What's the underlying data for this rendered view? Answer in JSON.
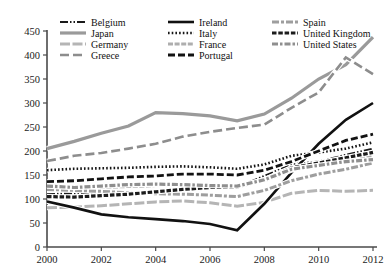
{
  "chart_data": {
    "type": "line",
    "title": "",
    "xlabel": "",
    "ylabel": "",
    "xlim": [
      2000,
      2012
    ],
    "ylim": [
      0,
      450
    ],
    "ytick_labels": [
      "0",
      "50",
      "100",
      "150",
      "200",
      "250",
      "300",
      "350",
      "400",
      "450"
    ],
    "yticks": [
      0,
      50,
      100,
      150,
      200,
      250,
      300,
      350,
      400,
      450
    ],
    "xtick_labels": [
      "2000",
      "2002",
      "2004",
      "2006",
      "2008",
      "2010",
      "2012"
    ],
    "xticks": [
      2000,
      2002,
      2004,
      2006,
      2008,
      2010,
      2012
    ],
    "grid": false,
    "legend_position": "top-left-inside",
    "x": [
      2000,
      2001,
      2002,
      2003,
      2004,
      2005,
      2006,
      2007,
      2008,
      2009,
      2010,
      2011,
      2012
    ],
    "series": [
      {
        "name": "Belgium",
        "values": [
          110,
          112,
          114,
          113,
          115,
          118,
          122,
          125,
          148,
          172,
          178,
          192,
          205
        ],
        "color": "#1a1a1a",
        "width": 2.0,
        "dash": "8,2,1.5,2,1.5,2"
      },
      {
        "name": "Japan",
        "values": [
          205,
          220,
          237,
          252,
          280,
          278,
          273,
          263,
          277,
          310,
          350,
          380,
          437
        ],
        "color": "#9a9a9a",
        "width": 3.2,
        "dash": "none"
      },
      {
        "name": "Germany",
        "values": [
          82,
          83,
          86,
          90,
          94,
          96,
          92,
          85,
          93,
          112,
          118,
          116,
          118
        ],
        "color": "#b5b5b5",
        "width": 3.0,
        "dash": "10,2.5"
      },
      {
        "name": "Greece",
        "values": [
          179,
          190,
          196,
          205,
          215,
          230,
          240,
          248,
          255,
          290,
          322,
          395,
          360
        ],
        "color": "#8d8d8d",
        "width": 2.6,
        "dash": "9,4"
      },
      {
        "name": "Ireland",
        "values": [
          95,
          82,
          68,
          62,
          58,
          54,
          48,
          35,
          90,
          155,
          215,
          265,
          300
        ],
        "color": "#111111",
        "width": 2.6,
        "dash": "none"
      },
      {
        "name": "Italy",
        "values": [
          160,
          163,
          164,
          165,
          167,
          168,
          166,
          163,
          172,
          190,
          197,
          205,
          218
        ],
        "color": "#161616",
        "width": 2.6,
        "dash": "1.6,2.1"
      },
      {
        "name": "France",
        "values": [
          120,
          122,
          124,
          126,
          128,
          130,
          128,
          126,
          138,
          160,
          170,
          178,
          190
        ],
        "color": "#aeaeae",
        "width": 3.0,
        "dash": "5,1.6"
      },
      {
        "name": "Portugal",
        "values": [
          136,
          138,
          142,
          146,
          148,
          152,
          152,
          150,
          160,
          178,
          200,
          222,
          235
        ],
        "color": "#121212",
        "width": 2.8,
        "dash": "7,3"
      },
      {
        "name": "Spain",
        "values": [
          120,
          118,
          116,
          113,
          111,
          110,
          108,
          105,
          118,
          138,
          152,
          162,
          175
        ],
        "color": "#9e9e9e",
        "width": 3.0,
        "dash": "7,2,3,2"
      },
      {
        "name": "United Kingdom",
        "values": [
          105,
          104,
          107,
          110,
          115,
          120,
          124,
          125,
          140,
          165,
          175,
          186,
          197
        ],
        "color": "#1c1c1c",
        "width": 3.2,
        "dash": "4.5,1.8"
      },
      {
        "name": "United States",
        "values": [
          127,
          124,
          127,
          130,
          131,
          130,
          128,
          127,
          140,
          162,
          170,
          178,
          182
        ],
        "color": "#8f8f8f",
        "width": 3.2,
        "dash": "6,2,2.5,2"
      }
    ],
    "legend_columns": [
      [
        "Belgium",
        "Japan",
        "Germany",
        "Greece"
      ],
      [
        "Ireland",
        "Italy",
        "France",
        "Portugal"
      ],
      [
        "Spain",
        "United Kingdom",
        "United States"
      ]
    ]
  }
}
